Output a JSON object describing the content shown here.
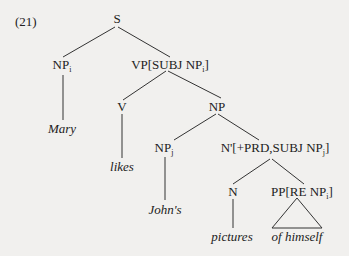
{
  "example_number": "(21)",
  "nodes": {
    "s": "S",
    "np_mary": {
      "cat": "NP",
      "sub": "i"
    },
    "vp": {
      "pre": "VP[SUBJ NP",
      "sub": "i",
      "post": "]"
    },
    "v": "V",
    "np_obj": "NP",
    "np_johns": {
      "cat": "NP",
      "sub": "j"
    },
    "nbar": {
      "pre": "N'[+PRD,SUBJ NP",
      "sub": "j",
      "post": "]"
    },
    "n": "N",
    "pp": {
      "pre": "PP[RE NP",
      "sub": "i",
      "post": "]"
    }
  },
  "leaves": {
    "mary": "Mary",
    "likes": "likes",
    "johns": "John's",
    "pictures": "pictures",
    "of_himself": "of himself"
  },
  "colors": {
    "line": "#333333",
    "background": "#f1f0ee"
  }
}
